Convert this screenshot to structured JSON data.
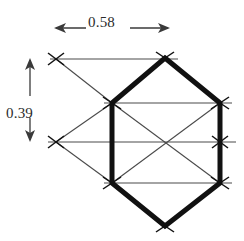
{
  "figure": {
    "background_color": "#ffffff",
    "ink_color": "#1a1a1a",
    "thin_line_color": "#4a4a4a",
    "bold_stroke_width": 5,
    "thin_stroke_width": 1.1,
    "tick_stroke_width": 1.3
  },
  "dimensions": {
    "width": {
      "value": "0.58",
      "orientation": "horizontal",
      "arrow_start_x": 54,
      "arrow_end_x": 170,
      "arrow_y": 28,
      "label_x": 88,
      "label_y": 14
    },
    "height": {
      "value": "0.39",
      "orientation": "vertical",
      "arrow_start_y": 58,
      "arrow_end_y": 142,
      "arrow_x": 30,
      "label_x": 6,
      "label_y": 105
    }
  },
  "hexagon": {
    "description": "bold outlined hexagon",
    "vertices": [
      {
        "name": "top",
        "x": 165,
        "y": 58
      },
      {
        "name": "upper-right",
        "x": 220,
        "y": 103
      },
      {
        "name": "lower-right",
        "x": 220,
        "y": 183
      },
      {
        "name": "bottom",
        "x": 165,
        "y": 226
      },
      {
        "name": "lower-left",
        "x": 112,
        "y": 183
      },
      {
        "name": "upper-left",
        "x": 112,
        "y": 103
      }
    ]
  },
  "lattice_nodes": [
    {
      "name": "node-top",
      "x": 165,
      "y": 58
    },
    {
      "name": "node-upper-left",
      "x": 112,
      "y": 103
    },
    {
      "name": "node-upper-right",
      "x": 220,
      "y": 103
    },
    {
      "name": "node-left-outer-top",
      "x": 56,
      "y": 59
    },
    {
      "name": "node-left-outer-mid",
      "x": 56,
      "y": 142
    },
    {
      "name": "node-center-right",
      "x": 220,
      "y": 142
    },
    {
      "name": "node-lower-left",
      "x": 112,
      "y": 183
    },
    {
      "name": "node-lower-right",
      "x": 220,
      "y": 183
    },
    {
      "name": "node-bottom",
      "x": 165,
      "y": 226
    }
  ],
  "thin_lines": [
    {
      "name": "horizontal-top",
      "x1": 50,
      "y1": 59,
      "x2": 178,
      "y2": 59
    },
    {
      "name": "horizontal-upper",
      "x1": 104,
      "y1": 103,
      "x2": 232,
      "y2": 103
    },
    {
      "name": "horizontal-middle",
      "x1": 48,
      "y1": 142,
      "x2": 236,
      "y2": 142
    },
    {
      "name": "horizontal-lower",
      "x1": 104,
      "y1": 183,
      "x2": 232,
      "y2": 183
    },
    {
      "name": "diagonal-outer-upper",
      "x1": 56,
      "y1": 59,
      "x2": 112,
      "y2": 103
    },
    {
      "name": "diagonal-outer-lower",
      "x1": 56,
      "y1": 142,
      "x2": 112,
      "y2": 103
    },
    {
      "name": "diagonal-outer-bottom",
      "x1": 56,
      "y1": 142,
      "x2": 112,
      "y2": 183
    },
    {
      "name": "diagonal-cell-down",
      "x1": 112,
      "y1": 103,
      "x2": 220,
      "y2": 183
    },
    {
      "name": "diagonal-cell-up",
      "x1": 112,
      "y1": 183,
      "x2": 220,
      "y2": 103
    }
  ]
}
